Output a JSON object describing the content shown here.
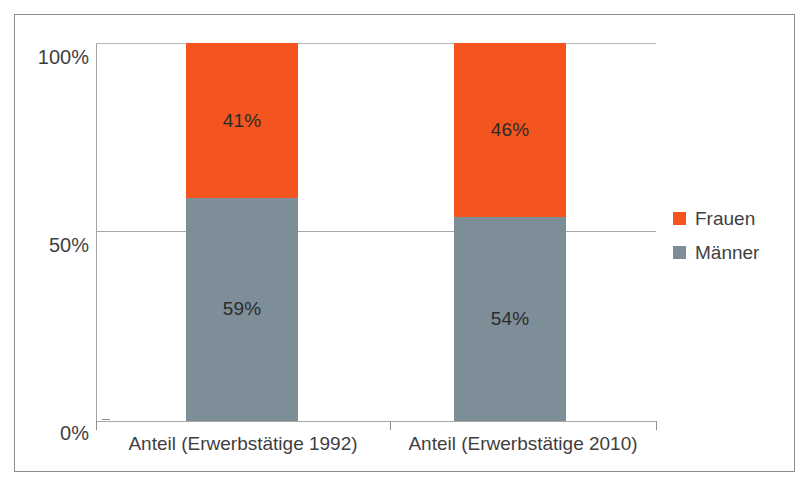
{
  "chart_data": {
    "type": "bar",
    "subtype": "stacked-percent",
    "title": "",
    "subtitle": "",
    "xlabel": "",
    "ylabel": "",
    "categories": [
      "Anteil (Erwerbstätige 1992)",
      "Anteil (Erwerbstätige 2010)"
    ],
    "series": [
      {
        "name": "Frauen",
        "values": [
          41,
          46
        ],
        "labels": [
          "41%",
          "46%"
        ],
        "color": "#f4541d"
      },
      {
        "name": "Männer",
        "values": [
          59,
          54
        ],
        "labels": [
          "59%",
          "54%"
        ],
        "color": "#7e8e99"
      }
    ],
    "ylim": [
      0,
      100
    ],
    "yticks": [
      0,
      50,
      100
    ],
    "ytick_labels": [
      "0%",
      "50%",
      "100%"
    ],
    "grid": true,
    "legend_position": "right",
    "value_suffix": "%"
  },
  "legend": {
    "items": [
      {
        "label": "Frauen",
        "color": "#f4541d"
      },
      {
        "label": "Männer",
        "color": "#7e8e99"
      }
    ]
  },
  "axis": {
    "y_labels": [
      "100%",
      "50%",
      "0%"
    ]
  },
  "colors": {
    "frauen": "#f4541d",
    "maenner": "#7e8e99",
    "gridline": "#a6a6a6",
    "frame": "#8d8d8d",
    "text": "#3f3f3f"
  }
}
